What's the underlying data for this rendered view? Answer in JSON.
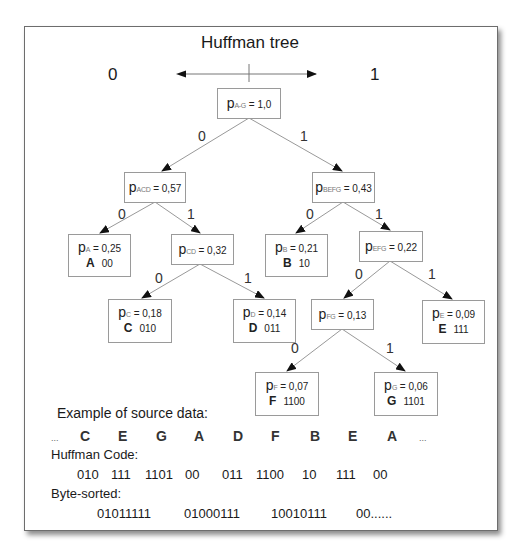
{
  "title": "Huffman tree",
  "direction": {
    "left": "0",
    "right": "1"
  },
  "nodes": [
    {
      "id": "root",
      "p": "p",
      "sub": "A-G",
      "value": "= 1,0"
    },
    {
      "id": "acd",
      "p": "p",
      "sub": "ACD",
      "value": "= 0,57"
    },
    {
      "id": "befg",
      "p": "p",
      "sub": "BEFG",
      "value": "= 0,43"
    },
    {
      "id": "a",
      "p": "p",
      "sub": "A",
      "value": "= 0,25",
      "symbol": "A",
      "code": "00"
    },
    {
      "id": "cd",
      "p": "p",
      "sub": "CD",
      "value": "= 0,32"
    },
    {
      "id": "b",
      "p": "p",
      "sub": "B",
      "value": "= 0,21",
      "symbol": "B",
      "code": "10"
    },
    {
      "id": "efg",
      "p": "p",
      "sub": "EFG",
      "value": "= 0,22"
    },
    {
      "id": "c",
      "p": "p",
      "sub": "C",
      "value": "= 0,18",
      "symbol": "C",
      "code": "010"
    },
    {
      "id": "d",
      "p": "p",
      "sub": "D",
      "value": "= 0,14",
      "symbol": "D",
      "code": "011"
    },
    {
      "id": "fg",
      "p": "p",
      "sub": "FG",
      "value": "= 0,13"
    },
    {
      "id": "e",
      "p": "p",
      "sub": "E",
      "value": "= 0,09",
      "symbol": "E",
      "code": "111"
    },
    {
      "id": "f",
      "p": "p",
      "sub": "F",
      "value": "= 0,07",
      "symbol": "F",
      "code": "1100"
    },
    {
      "id": "g",
      "p": "p",
      "sub": "G",
      "value": "= 0,06",
      "symbol": "G",
      "code": "1101"
    }
  ],
  "edge_labels": [
    "0",
    "1",
    "0",
    "1",
    "0",
    "1",
    "0",
    "1",
    "0",
    "1",
    "0",
    "1"
  ],
  "example": {
    "label": "Example of source data:",
    "ellipsis": "...",
    "sequence": [
      "C",
      "E",
      "G",
      "A",
      "D",
      "F",
      "B",
      "E",
      "A"
    ],
    "huffman_label": "Huffman Code:",
    "codes": [
      "010",
      "111",
      "1101",
      "00",
      "011",
      "1100",
      "10",
      "111",
      "00"
    ],
    "byte_label": "Byte-sorted:",
    "bytes": [
      "01011111",
      "01000111",
      "10010111",
      "00......"
    ]
  }
}
